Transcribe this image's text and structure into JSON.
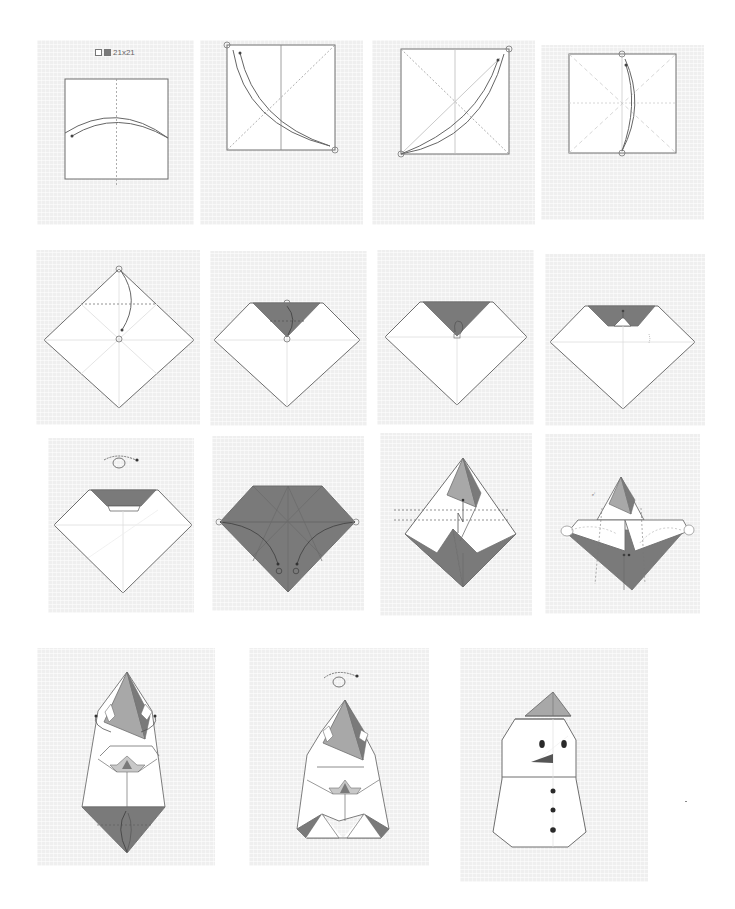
{
  "diagram": {
    "type": "origami-instructions",
    "paper": {
      "size_label": "21x21",
      "front_color": "#ffffff",
      "back_color": "#7a7a7a"
    },
    "colors": {
      "panel_bg": "#efefef",
      "paper_white": "#ffffff",
      "paper_dark": "#7a7a7a",
      "paper_mid": "#a8a8a8",
      "outline": "#6e6e6e",
      "crease": "#c8c8c8",
      "fold_line": "#555555",
      "feature_dark": "#2a2a2a"
    },
    "steps": [
      {
        "id": 1,
        "row": 1,
        "description": "square, fold in half vertically and unfold",
        "symbols": [
          "valley-fold-arrow"
        ]
      },
      {
        "id": 2,
        "row": 1,
        "description": "fold diagonally corner to corner and unfold",
        "symbols": [
          "valley-fold-arrow",
          "reference-circles"
        ]
      },
      {
        "id": 3,
        "row": 1,
        "description": "fold the other diagonal and unfold",
        "symbols": [
          "valley-fold-arrow",
          "reference-circles"
        ]
      },
      {
        "id": 4,
        "row": 1,
        "description": "fold top edge to bottom edge and unfold",
        "symbols": [
          "valley-fold-arrow",
          "reference-circles"
        ]
      },
      {
        "id": 5,
        "row": 2,
        "description": "diamond orientation, fold top corner down to center",
        "symbols": [
          "valley-fold-arrow",
          "reference-circles"
        ]
      },
      {
        "id": 6,
        "row": 2,
        "description": "fold the tip back up",
        "symbols": [
          "valley-fold-arrow",
          "reference-circles"
        ]
      },
      {
        "id": 7,
        "row": 2,
        "description": "fold tip down again",
        "symbols": [
          "valley-fold-arrow"
        ]
      },
      {
        "id": 8,
        "row": 2,
        "description": "small pleat formed",
        "symbols": [
          "valley-fold-arrow"
        ]
      },
      {
        "id": 9,
        "row": 3,
        "description": "turn the model over",
        "symbols": [
          "turn-over-symbol"
        ]
      },
      {
        "id": 10,
        "row": 3,
        "description": "fold side corners to marked points",
        "symbols": [
          "valley-fold-arrow",
          "reference-circles"
        ]
      },
      {
        "id": 11,
        "row": 3,
        "description": "pleat fold",
        "symbols": [
          "pleat-arrow",
          "valley-fold-lines"
        ]
      },
      {
        "id": 12,
        "row": 3,
        "description": "squash side flaps",
        "symbols": [
          "squash-symbol"
        ]
      },
      {
        "id": 13,
        "row": 4,
        "description": "fold sides behind, fold bottom up",
        "symbols": [
          "mountain-fold-arrow",
          "valley-fold-arrow"
        ]
      },
      {
        "id": 14,
        "row": 4,
        "description": "turn the model over",
        "symbols": [
          "turn-over-symbol"
        ]
      },
      {
        "id": 15,
        "row": 4,
        "description": "completed snowman with hat, eyes, nose and buttons",
        "symbols": []
      }
    ]
  }
}
